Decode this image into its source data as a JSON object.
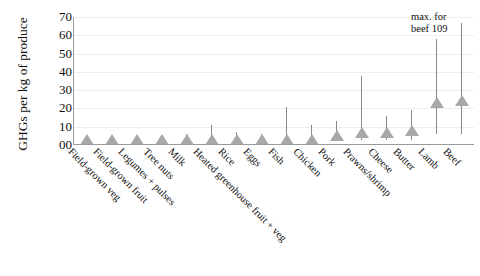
{
  "chart_data": {
    "type": "bar",
    "title": "",
    "xlabel": "",
    "ylabel": "GHGs per kg of produce",
    "ylim": [
      0,
      70
    ],
    "yticks": [
      "00",
      "10",
      "20",
      "30",
      "40",
      "50",
      "60",
      "70"
    ],
    "ytick_values": [
      0,
      10,
      20,
      30,
      40,
      50,
      60,
      70
    ],
    "grid": true,
    "legend": "none",
    "marker_style": "triangle",
    "error_bars": true,
    "categories": [
      "Field-grown veg",
      "Field-grown fruit",
      "Legumes + pulses",
      "Tree nuts",
      "Milk",
      "Heated greenhouse fruit + veg",
      "Rice",
      "Eggs",
      "Fish",
      "Chicken",
      "Pork",
      "Prawns/shrimp",
      "Cheese",
      "Butter",
      "Lamb",
      "Beef"
    ],
    "values": [
      1,
      1,
      1,
      2,
      3,
      4,
      4,
      4,
      5,
      5,
      7,
      9,
      9,
      10,
      25,
      26
    ],
    "error_high": [
      3,
      3,
      3,
      5,
      6,
      11,
      7,
      6,
      21,
      11,
      13,
      38,
      16,
      19,
      58,
      67
    ],
    "error_low": [
      0,
      0,
      0,
      0,
      0,
      0,
      0,
      0,
      1,
      1,
      2,
      3,
      3,
      3,
      6,
      6
    ],
    "annotation": {
      "line1": "max. for",
      "line2": "beef 109",
      "attached_to": "Beef",
      "value": 109
    },
    "colors": {
      "marker": "#a8a8a8",
      "error_bar": "#8a8a8a",
      "axis": "#9a9a9a",
      "gridline": "#ededed",
      "text": "#111111",
      "background": "#ffffff"
    }
  }
}
